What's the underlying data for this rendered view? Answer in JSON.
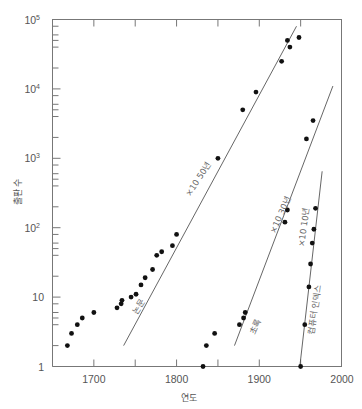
{
  "chart_data": {
    "type": "scatter",
    "title": "",
    "xlabel": "연도",
    "ylabel": "출판 수",
    "xlim": [
      1650,
      2000
    ],
    "ylim": [
      1,
      100000
    ],
    "yscale": "log",
    "grid": false,
    "x_ticks": [
      1700,
      1800,
      1900,
      2000
    ],
    "x_minor_ticks": [
      1750,
      1850,
      1950
    ],
    "y_ticks": [
      {
        "value": 1,
        "label": "1"
      },
      {
        "value": 10,
        "label": "10"
      },
      {
        "value": 100,
        "label": "10²"
      },
      {
        "value": 1000,
        "label": "10³"
      },
      {
        "value": 10000,
        "label": "10⁴"
      },
      {
        "value": 100000,
        "label": "10⁵"
      }
    ],
    "series": [
      {
        "name": "논문",
        "trend_label": "×10 50년",
        "points": [
          [
            1668,
            2
          ],
          [
            1673,
            3
          ],
          [
            1680,
            4
          ],
          [
            1686,
            5
          ],
          [
            1700,
            6
          ],
          [
            1728,
            7
          ],
          [
            1733,
            8
          ],
          [
            1734,
            9
          ],
          [
            1745,
            10
          ],
          [
            1751,
            11
          ],
          [
            1757,
            15
          ],
          [
            1762,
            19
          ],
          [
            1771,
            25
          ],
          [
            1776,
            40
          ],
          [
            1782,
            45
          ],
          [
            1795,
            55
          ],
          [
            1800,
            80
          ],
          [
            1850,
            1000
          ],
          [
            1880,
            5000
          ],
          [
            1896,
            9000
          ],
          [
            1927,
            25000
          ],
          [
            1934,
            50000
          ],
          [
            1937,
            40000
          ],
          [
            1948,
            55000
          ]
        ],
        "trend_line": [
          [
            1736,
            2
          ],
          [
            1945,
            80000
          ]
        ]
      },
      {
        "name": "초록",
        "trend_label": "×10 30년",
        "points": [
          [
            1832,
            1
          ],
          [
            1836,
            2
          ],
          [
            1846,
            3
          ],
          [
            1876,
            4
          ],
          [
            1881,
            5
          ],
          [
            1883,
            6
          ],
          [
            1931,
            120
          ],
          [
            1934,
            180
          ],
          [
            1957,
            1900
          ],
          [
            1965,
            3500
          ]
        ],
        "trend_line": [
          [
            1870,
            2
          ],
          [
            1989,
            11000
          ]
        ]
      },
      {
        "name": "컴퓨터 인덱스",
        "trend_label": "×10 10년",
        "points": [
          [
            1950,
            1
          ],
          [
            1955,
            4
          ],
          [
            1960,
            14
          ],
          [
            1962,
            30
          ],
          [
            1964,
            60
          ],
          [
            1966,
            95
          ],
          [
            1968,
            190
          ]
        ],
        "trend_line": [
          [
            1949,
            1
          ],
          [
            1976,
            650
          ]
        ]
      }
    ]
  },
  "axis": {
    "xlabel": "연도",
    "ylabel": "출판 수",
    "xticks": [
      "1700",
      "1800",
      "1900",
      "2000"
    ],
    "yticks": [
      "1",
      "10",
      "10",
      "10",
      "10",
      "10"
    ],
    "yexp": [
      "",
      "",
      "2",
      "3",
      "4",
      "5"
    ]
  },
  "labels": {
    "papers": "논문",
    "abstracts": "초록",
    "index": "컴퓨터 인덱스",
    "rate50": "×10 50년",
    "rate30": "×10 30년",
    "rate10": "×10 10년"
  }
}
